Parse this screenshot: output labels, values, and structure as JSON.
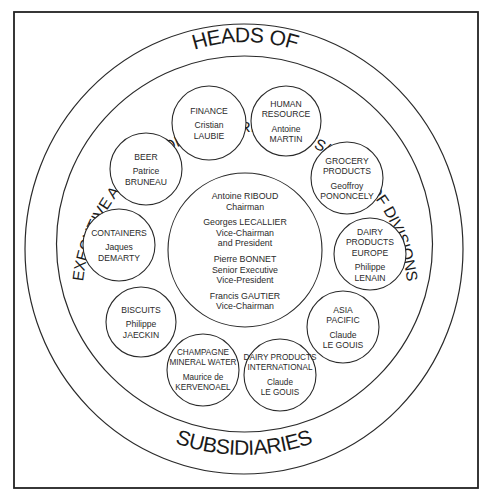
{
  "outer_ring": {
    "top_label": "HEADS OF",
    "bottom_label": "SUBSIDIARIES"
  },
  "middle_ring": {
    "arc_label": "EXECUTIVE AND SENIOR VICE-PRESIDENTS/HEADS OF DIVISIONS"
  },
  "center": {
    "executives": [
      {
        "name": "Antoine RIBOUD",
        "title_lines": [
          "Chairman"
        ]
      },
      {
        "name": "Georges LECALLIER",
        "title_lines": [
          "Vice-Chairman",
          "and President"
        ]
      },
      {
        "name": "Pierre BONNET",
        "title_lines": [
          "Senior Executive",
          "Vice-President"
        ]
      },
      {
        "name": "Francis GAUTIER",
        "title_lines": [
          "Vice-Chairman"
        ]
      }
    ]
  },
  "divisions": [
    {
      "dept_lines": [
        "FINANCE"
      ],
      "person_lines": [
        "Cristian",
        "LAUBIE"
      ]
    },
    {
      "dept_lines": [
        "HUMAN",
        "RESOURCE"
      ],
      "person_lines": [
        "Antoine",
        "MARTIN"
      ]
    },
    {
      "dept_lines": [
        "GROCERY",
        "PRODUCTS"
      ],
      "person_lines": [
        "Geoffroy",
        "PONONCELY"
      ]
    },
    {
      "dept_lines": [
        "DAIRY",
        "PRODUCTS",
        "EUROPE"
      ],
      "person_lines": [
        "Philippe",
        "LENAIN"
      ]
    },
    {
      "dept_lines": [
        "ASIA",
        "PACIFIC"
      ],
      "person_lines": [
        "Claude",
        "LE GOUIS"
      ]
    },
    {
      "dept_lines": [
        "DAIRY PRODUCTS",
        "INTERNATIONAL"
      ],
      "person_lines": [
        "Claude",
        "LE GOUIS"
      ]
    },
    {
      "dept_lines": [
        "CHAMPAGNE",
        "MINERAL WATER"
      ],
      "person_lines": [
        "Maurice de",
        "KERVENOAEL"
      ]
    },
    {
      "dept_lines": [
        "BISCUITS"
      ],
      "person_lines": [
        "Philippe",
        "JAECKIN"
      ]
    },
    {
      "dept_lines": [
        "CONTAINERS"
      ],
      "person_lines": [
        "Jaques",
        "DEMARTY"
      ]
    },
    {
      "dept_lines": [
        "BEER"
      ],
      "person_lines": [
        "Patrice",
        "BRUNEAU"
      ]
    }
  ],
  "colors": {
    "line": "#2a2a2a",
    "text": "#1a1a1a",
    "background": "#ffffff"
  }
}
